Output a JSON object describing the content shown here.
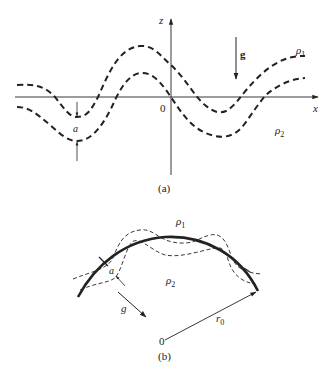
{
  "figure": {
    "panel_a": {
      "caption": "(a)",
      "axis_x_label": "x",
      "axis_z_label": "z",
      "origin_label": "0",
      "gravity_label": "g",
      "upper_fluid_label": "ρ",
      "upper_fluid_sub": "1",
      "lower_fluid_label": "ρ",
      "lower_fluid_sub": "2",
      "thickness_label": "a"
    },
    "panel_b": {
      "caption": "(b)",
      "origin_label": "0",
      "radius_label": "r",
      "radius_sub": "0",
      "gravity_label": "g",
      "outer_fluid_label": "ρ",
      "outer_fluid_sub": "1",
      "inner_fluid_label": "ρ",
      "inner_fluid_sub": "2",
      "thickness_label": "a"
    },
    "colors": {
      "ink": "#222222",
      "background": "#ffffff"
    }
  }
}
